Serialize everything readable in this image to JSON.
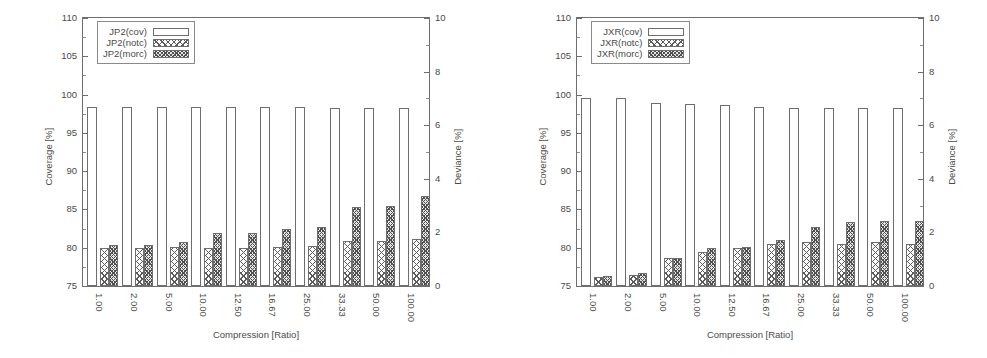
{
  "figure": {
    "width": 987,
    "height": 358,
    "background": "#ffffff",
    "axis_color": "#6e6e6e",
    "text_color": "#4a4a4a"
  },
  "chart_data": [
    {
      "type": "bar",
      "title": "",
      "panel": "left",
      "xlabel": "Compression [Ratio]",
      "ylabel": "Coverage [%]",
      "ylabel_secondary": "Deviance [%]",
      "categories": [
        "1.00",
        "2.00",
        "5.00",
        "10.00",
        "12.50",
        "16.67",
        "25.00",
        "33.33",
        "50.00",
        "100.00"
      ],
      "ylim": [
        75,
        110
      ],
      "yticks": [
        75,
        80,
        85,
        90,
        95,
        100,
        105,
        110
      ],
      "ylim_secondary": [
        0,
        10
      ],
      "yticks_secondary": [
        0,
        2,
        4,
        6,
        8,
        10
      ],
      "grid": false,
      "legend_position": "top-left",
      "series": [
        {
          "name": "JP2(cov)",
          "axis": "left",
          "units": "%",
          "pattern": "open",
          "values": [
            98.4,
            98.4,
            98.4,
            98.4,
            98.4,
            98.4,
            98.4,
            98.3,
            98.3,
            98.3
          ]
        },
        {
          "name": "JP2(notc)",
          "axis": "left",
          "units": "%",
          "pattern": "light-crosshatch",
          "values": [
            79.9,
            79.9,
            80.1,
            79.9,
            80.0,
            80.1,
            80.2,
            80.9,
            80.9,
            81.2
          ]
        },
        {
          "name": "JP2(morc)",
          "axis": "left",
          "units": "%",
          "pattern": "dense-crosshatch",
          "values": [
            80.4,
            80.4,
            80.7,
            81.9,
            81.9,
            82.5,
            82.7,
            85.3,
            85.4,
            86.7
          ]
        }
      ]
    },
    {
      "type": "bar",
      "title": "",
      "panel": "right",
      "xlabel": "Compression [Ratio]",
      "ylabel": "Coverage [%]",
      "ylabel_secondary": "Deviance [%]",
      "categories": [
        "1.00",
        "2.00",
        "5.00",
        "10.00",
        "12.50",
        "16.67",
        "25.00",
        "33.33",
        "50.00",
        "100.00"
      ],
      "ylim": [
        75,
        110
      ],
      "yticks": [
        75,
        80,
        85,
        90,
        95,
        100,
        105,
        110
      ],
      "ylim_secondary": [
        0,
        10
      ],
      "yticks_secondary": [
        0,
        2,
        4,
        6,
        8,
        10
      ],
      "grid": false,
      "legend_position": "top-left",
      "series": [
        {
          "name": "JXR(cov)",
          "axis": "left",
          "units": "%",
          "pattern": "open",
          "values": [
            99.6,
            99.5,
            98.9,
            98.8,
            98.6,
            98.4,
            98.3,
            98.3,
            98.3,
            98.3
          ]
        },
        {
          "name": "JXR(notc)",
          "axis": "left",
          "units": "%",
          "pattern": "light-crosshatch",
          "values": [
            76.2,
            76.5,
            78.6,
            79.5,
            79.9,
            80.5,
            80.8,
            80.5,
            80.7,
            80.5
          ]
        },
        {
          "name": "JXR(morc)",
          "axis": "left",
          "units": "%",
          "pattern": "dense-crosshatch",
          "values": [
            76.3,
            76.7,
            78.7,
            80.0,
            80.1,
            81.0,
            82.7,
            83.4,
            83.5,
            83.5
          ]
        }
      ]
    }
  ],
  "panels": [
    {
      "id": "left",
      "axis_titles": {
        "y_left": "Coverage [%]",
        "y_right": "Deviance [%]",
        "x": "Compression [Ratio]"
      },
      "y_left_ticks": [
        "110",
        "105",
        "100",
        "95",
        "90",
        "85",
        "80",
        "75"
      ],
      "y_right_ticks": [
        "10",
        "8",
        "6",
        "4",
        "2",
        "0"
      ],
      "x_ticks": [
        "1.00",
        "2.00",
        "5.00",
        "10.00",
        "12.50",
        "16.67",
        "25.00",
        "33.33",
        "50.00",
        "100.00"
      ],
      "legend": [
        {
          "label": "JP2(cov)",
          "pattern": "cov"
        },
        {
          "label": "JP2(notc)",
          "pattern": "notc"
        },
        {
          "label": "JP2(morc)",
          "pattern": "morc"
        }
      ]
    },
    {
      "id": "right",
      "axis_titles": {
        "y_left": "Coverage [%]",
        "y_right": "Deviance [%]",
        "x": "Compression [Ratio]"
      },
      "y_left_ticks": [
        "110",
        "105",
        "100",
        "95",
        "90",
        "85",
        "80",
        "75"
      ],
      "y_right_ticks": [
        "10",
        "8",
        "6",
        "4",
        "2",
        "0"
      ],
      "x_ticks": [
        "1.00",
        "2.00",
        "5.00",
        "10.00",
        "12.50",
        "16.67",
        "25.00",
        "33.33",
        "50.00",
        "100.00"
      ],
      "legend": [
        {
          "label": "JXR(cov)",
          "pattern": "cov"
        },
        {
          "label": "JXR(notc)",
          "pattern": "notc"
        },
        {
          "label": "JXR(morc)",
          "pattern": "morc"
        }
      ]
    }
  ]
}
